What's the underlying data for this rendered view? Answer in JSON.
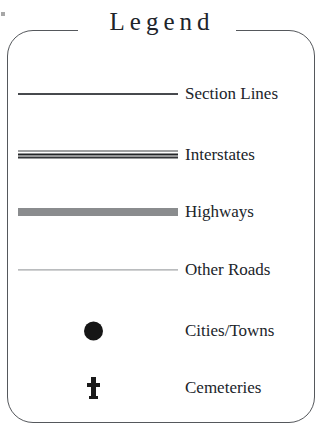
{
  "legend": {
    "title": "Legend",
    "title_style": "serif-letterspaced",
    "frame": {
      "shape": "rounded-rectangle",
      "border_color": "#55585c",
      "corner_radius_px": 26
    },
    "rows": [
      {
        "symbol": "section-line-symbol",
        "symbol_type": "thin-solid-line",
        "symbol_color": "#2a2d31",
        "label": "Section Lines"
      },
      {
        "symbol": "interstate-line-symbol",
        "symbol_type": "triple-parallel-line",
        "symbol_color": "#17191c",
        "label": "Interstates"
      },
      {
        "symbol": "highway-line-symbol",
        "symbol_type": "thick-gray-band",
        "symbol_color": "#8a8c8e",
        "label": "Highways"
      },
      {
        "symbol": "other-road-line-symbol",
        "symbol_type": "hairline",
        "symbol_color": "#6e7276",
        "label": "Other Roads"
      },
      {
        "symbol": "city-dot-symbol",
        "symbol_type": "filled-circle",
        "symbol_color": "#161616",
        "label": "Cities/Towns"
      },
      {
        "symbol": "cemetery-cross-symbol",
        "symbol_type": "latin-cross",
        "symbol_color": "#1a1a1a",
        "label": "Cemeteries"
      }
    ]
  }
}
